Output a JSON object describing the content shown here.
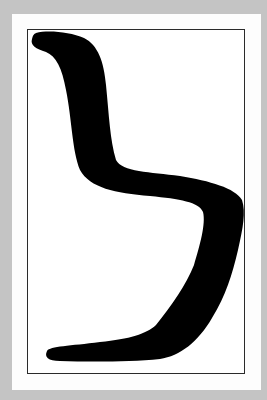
{
  "image": {
    "subject": "black silhouette of a cantilever S-shaped chair",
    "background_color": "#c4c4c4",
    "card_color": "#fdfdfd",
    "frame_color": "#2a2a2a",
    "silhouette_color": "#000000"
  }
}
